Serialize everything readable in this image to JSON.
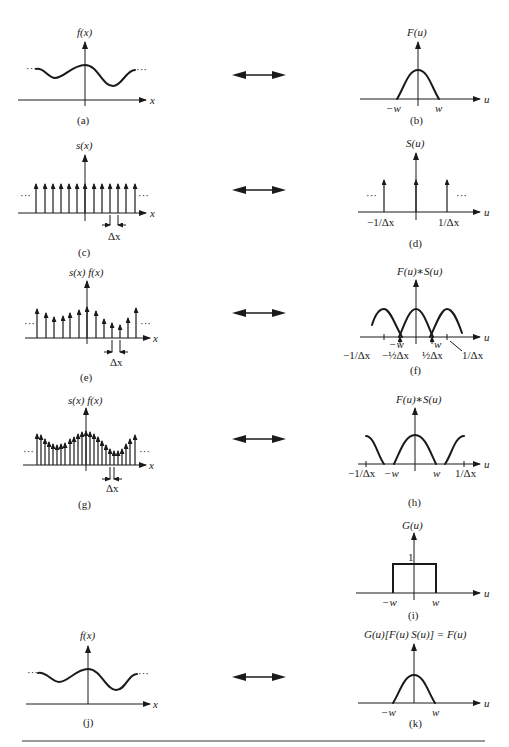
{
  "figure": {
    "panels": [
      {
        "id": "a",
        "caption": "(a)",
        "ylabel": "f(x)",
        "xlabel": "x",
        "ticks": []
      },
      {
        "id": "b",
        "caption": "(b)",
        "ylabel": "F(u)",
        "xlabel": "u",
        "ticks": [
          "−w",
          "w"
        ]
      },
      {
        "id": "c",
        "caption": "(c)",
        "ylabel": "s(x)",
        "xlabel": "x",
        "ticks": [
          "Δx"
        ],
        "ellipsis": "···"
      },
      {
        "id": "d",
        "caption": "(d)",
        "ylabel": "S(u)",
        "xlabel": "u",
        "ticks": [
          "−1/Δx",
          "1/Δx"
        ],
        "ellipsis": "···"
      },
      {
        "id": "e",
        "caption": "(e)",
        "ylabel": "s(x) f(x)",
        "xlabel": "x",
        "ticks": [
          "Δx"
        ],
        "ellipsis": "···"
      },
      {
        "id": "f",
        "caption": "(f)",
        "ylabel": "F(u)∗S(u)",
        "xlabel": "u",
        "ticks": [
          "−1/Δx",
          "−w",
          "−½Δx",
          "½Δx",
          "w",
          "1/Δx"
        ]
      },
      {
        "id": "g",
        "caption": "(g)",
        "ylabel": "s(x) f(x)",
        "xlabel": "x",
        "ticks": [
          "Δx"
        ],
        "ellipsis": "···"
      },
      {
        "id": "h",
        "caption": "(h)",
        "ylabel": "F(u)∗S(u)",
        "xlabel": "u",
        "ticks": [
          "−1/Δx",
          "−w",
          "w",
          "1/Δx"
        ]
      },
      {
        "id": "i",
        "caption": "(i)",
        "ylabel": "G(u)",
        "xlabel": "u",
        "ticks": [
          "−w",
          "w"
        ],
        "level": "1"
      },
      {
        "id": "j",
        "caption": "(j)",
        "ylabel": "f(x)",
        "xlabel": "x",
        "ticks": []
      },
      {
        "id": "k",
        "caption": "(k)",
        "ylabel": "G(u)[F(u)  S(u)] = F(u)",
        "xlabel": "u",
        "ticks": [
          "−w",
          "w"
        ]
      }
    ],
    "pair_arrow": "↔",
    "colors": {
      "ink": "#1a1a1a",
      "background": "#ffffff"
    }
  }
}
